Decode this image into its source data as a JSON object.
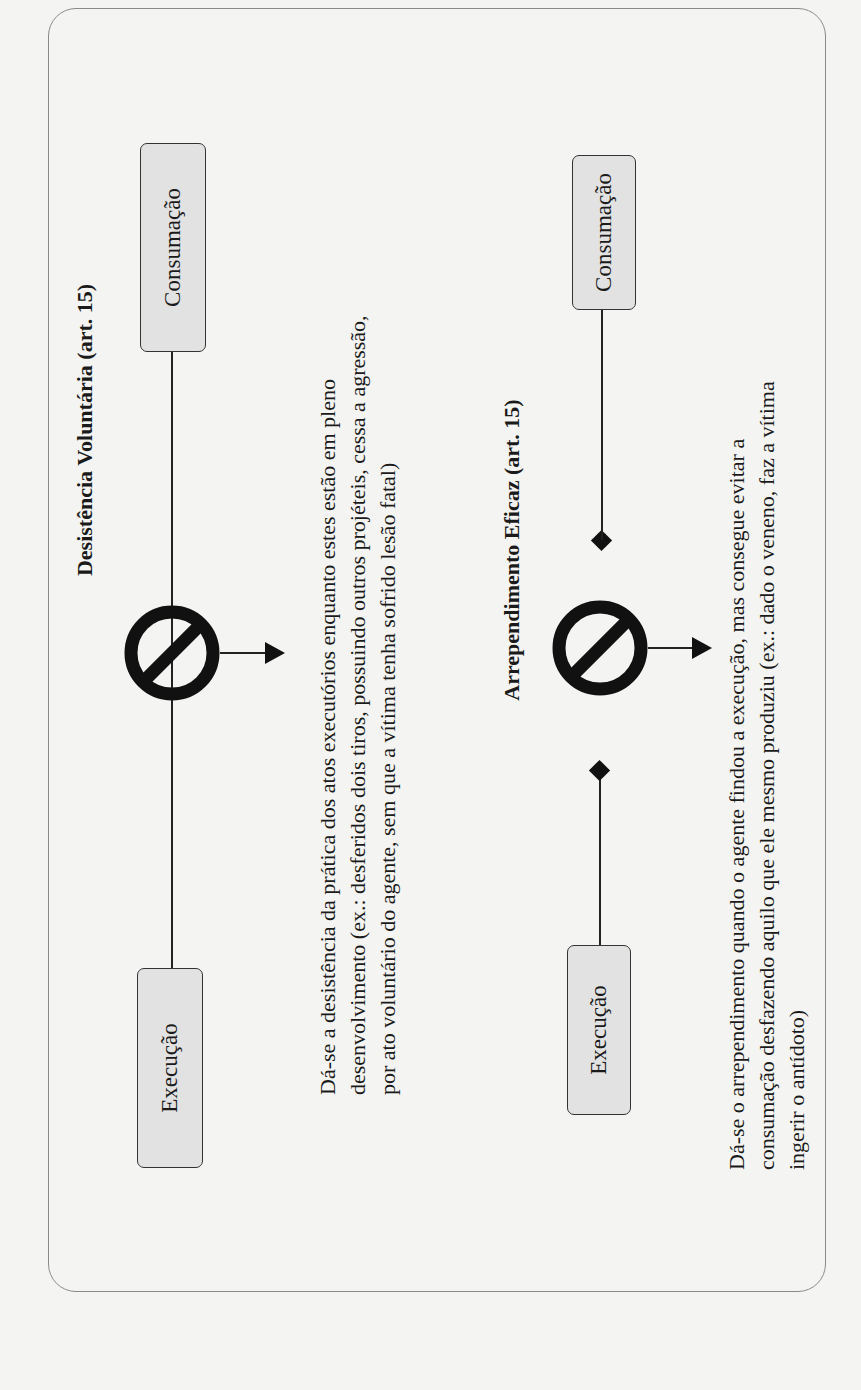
{
  "diagrams": [
    {
      "title": "Desistência Voluntária (art. 15)",
      "start_box": "Execução",
      "end_box": "Consumação",
      "interruption_icon": "prohibited-icon",
      "connector_style": "continuous-line",
      "description_lines": [
        "Dá-se a desistência da prática dos atos executórios enquanto estes estão em pleno",
        "desenvolvimento (ex.: desferidos dois tiros, possuindo outros projéteis, cessa a agressão,",
        "por ato voluntário do agente, sem que a vítima tenha sofrido lesão fatal)"
      ]
    },
    {
      "title": "Arrependimento Eficaz (art. 15)",
      "start_box": "Execução",
      "end_box": "Consumação",
      "interruption_icon": "prohibited-icon",
      "connector_style": "broken-line-with-diamonds",
      "description_lines": [
        "Dá-se o arrependimento quando o agente findou a execução, mas consegue evitar a",
        "consumação desfazendo aquilo que ele mesmo produziu (ex.: dado o veneno, faz a vítima",
        "ingerir o antídoto)"
      ]
    }
  ],
  "colors": {
    "background": "#f4f4f2",
    "box_fill": "#e2e2e2",
    "stroke": "#222222",
    "frame_border": "#8a8a8a"
  },
  "orientation": "rotated-90-counterclockwise"
}
